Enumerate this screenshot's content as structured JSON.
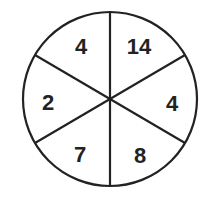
{
  "spinner": {
    "sections": [
      {
        "label": "4",
        "position": "top-left"
      },
      {
        "label": "14",
        "position": "top-right"
      },
      {
        "label": "4",
        "position": "right"
      },
      {
        "label": "8",
        "position": "bottom-right"
      },
      {
        "label": "7",
        "position": "bottom-left"
      },
      {
        "label": "2",
        "position": "left"
      }
    ],
    "colors": {
      "stroke": "#222222",
      "fill": "#ffffff"
    }
  }
}
